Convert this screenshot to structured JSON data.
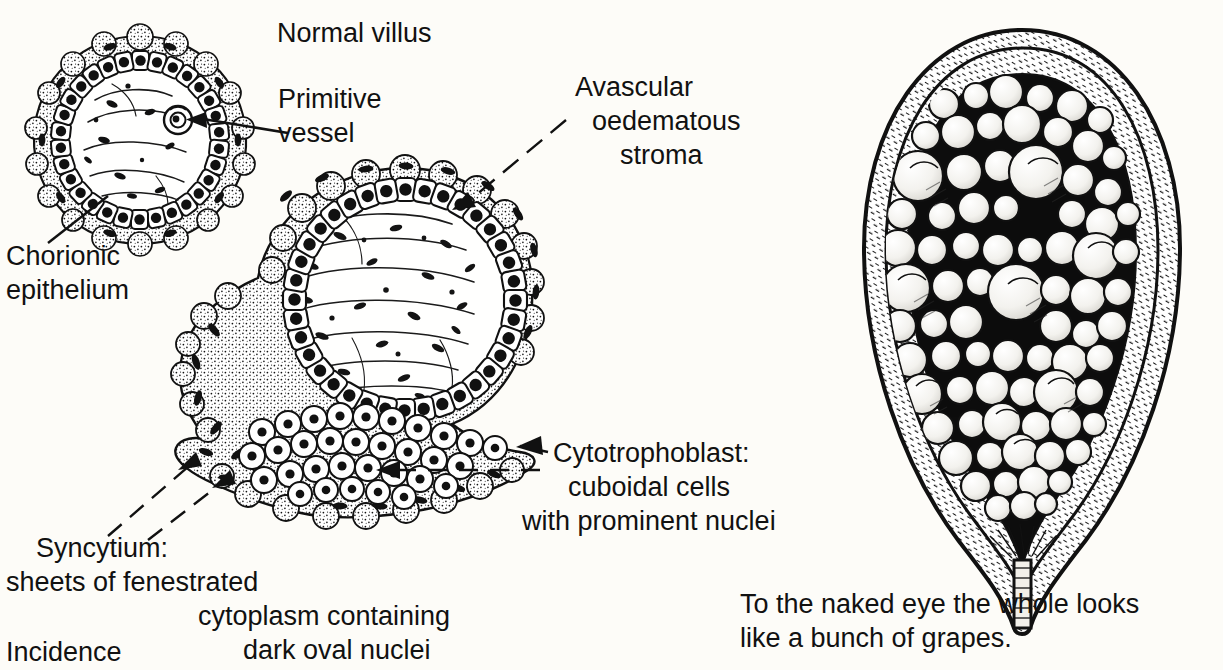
{
  "figure": {
    "title_label": "Normal villus",
    "background_color": "#fdfcf8",
    "ink_color": "#111111"
  },
  "labels": {
    "normal_villus": "Normal villus",
    "primitive_vessel_line1": "Primitive",
    "primitive_vessel_line2": "vessel",
    "chorionic_epithelium_line1": "Chorionic",
    "chorionic_epithelium_line2": "epithelium",
    "avascular_line1": "Avascular",
    "avascular_line2": "oedematous",
    "avascular_line3": "stroma",
    "cytotrophoblast_line1": "Cytotrophoblast:",
    "cytotrophoblast_line2": "cuboidal cells",
    "cytotrophoblast_line3": "with prominent nuclei",
    "syncytium_line1": "Syncytium:",
    "syncytium_line2": "sheets of fenestrated",
    "syncytium_line3": "cytoplasm containing",
    "syncytium_line4": "dark oval nuclei",
    "naked_eye_line1": "To the naked eye the whole looks",
    "naked_eye_line2": "like a bunch of grapes.",
    "incidence": "Incidence"
  },
  "diagram_parts": {
    "normal_villus_drawing": "cross-section of small chorionic villus with ring of cuboidal trophoblast cells and central primitive vessel",
    "molar_villus_drawing": "enlarged avascular oedematous villus with syncytium sheet and cytotrophoblast cell mass",
    "uterus_drawing": "gross specimen: uterus cut open showing cavity filled with grape-like vesicles and cervical canal"
  }
}
